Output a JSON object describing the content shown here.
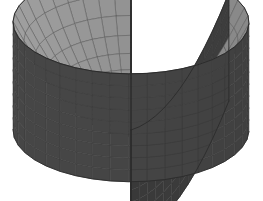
{
  "figure": {
    "type": "3d-surface-plot",
    "title": "",
    "background_color": "#ffffff",
    "width": 263,
    "height": 201
  },
  "chart_data": {
    "type": "surface",
    "title": "",
    "xlabel": "",
    "ylabel": "",
    "zlabel": "",
    "surface_equation": "z = r^2",
    "domain": {
      "r_min": 0.0,
      "r_max": 1.0,
      "theta_min_deg": 28,
      "theta_max_deg": 332
    },
    "zlim": [
      0.0,
      1.0
    ],
    "grid": true,
    "legend": false,
    "axes_visible": false,
    "tick_labels": [],
    "annotations": [],
    "mesh": {
      "radial_divisions": 11,
      "angular_divisions": 34,
      "wall_height": 1.0
    },
    "view": {
      "elevation_deg": 26,
      "azimuth_deg": -62,
      "projection": "orthographic"
    },
    "colors": {
      "inner_surface_light": "#a6a6a6",
      "inner_surface_dark": "#7c7c7c",
      "outer_wall": "#4c4c4c",
      "outer_wall_dark": "#3d3d3d",
      "cut_face_left": "#5a5a5a",
      "cut_face_right": "#4a4a4a",
      "rim_edge": "#6e6e6e",
      "mesh_line": "#3a3a3a",
      "mesh_line_light": "#595959",
      "silhouette": "#2b2b2b",
      "background": "#ffffff"
    }
  },
  "geometry_hints": {
    "rim_top_y": 12,
    "rim_left_x": 13,
    "rim_right_tip_x": 250,
    "rim_right_tip_y": 28,
    "bottom_left_corner": [
      13,
      135
    ],
    "bottom_front_point": [
      100,
      172
    ],
    "bottom_right_point": [
      196,
      189
    ],
    "notch_apex": [
      118,
      106
    ]
  },
  "accessibility": {
    "alt_text": "Grayscale wireframe plot of a bowl-shaped paraboloid surface with a pie-slice wedge cut out of the front."
  }
}
